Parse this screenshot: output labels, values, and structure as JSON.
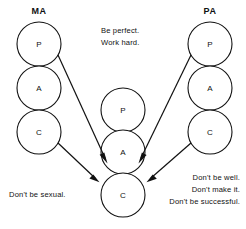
{
  "diagram": {
    "background_color": "#ffffff",
    "ink_color": "#111111"
  },
  "columns": [
    {
      "id": "ma",
      "header": "MA",
      "states": [
        {
          "label": "P"
        },
        {
          "label": "A"
        },
        {
          "label": "C"
        }
      ]
    },
    {
      "id": "child",
      "header": "",
      "states": [
        {
          "label": "P"
        },
        {
          "label": "A"
        },
        {
          "label": "C"
        }
      ]
    },
    {
      "id": "pa",
      "header": "PA",
      "states": [
        {
          "label": "P"
        },
        {
          "label": "A"
        },
        {
          "label": "C"
        }
      ]
    }
  ],
  "captions": {
    "drivers": {
      "lines": [
        "Be perfect.",
        "Work hard."
      ]
    },
    "left_injunction": {
      "lines": [
        "Don't be sexual."
      ]
    },
    "right_injunctions": {
      "lines": [
        "Don't be well.",
        "Don't make it.",
        "Don't be successful."
      ]
    }
  }
}
